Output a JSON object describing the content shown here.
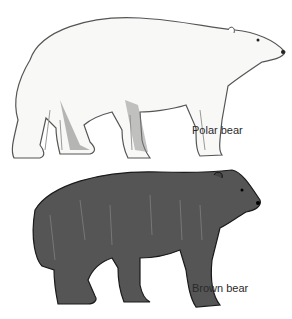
{
  "figure": {
    "bears": [
      {
        "name": "polar-bear",
        "label": "Polar bear",
        "fur_color": "#f7f7f5",
        "outline_color": "#444444"
      },
      {
        "name": "brown-bear",
        "label": "Brown bear",
        "fur_color": "#4a4a4a",
        "outline_color": "#1a1a1a"
      }
    ]
  }
}
